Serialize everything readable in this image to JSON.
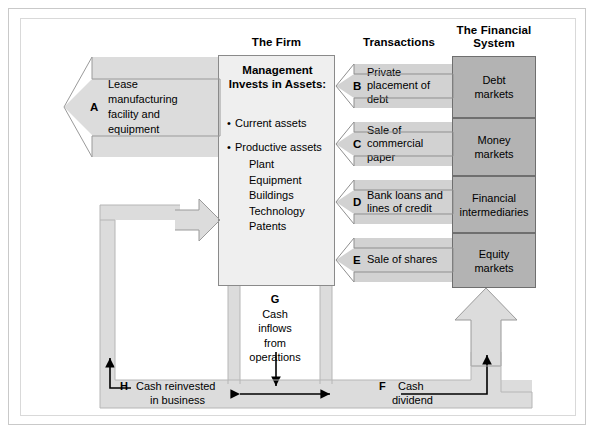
{
  "column_titles": {
    "firm": "The Firm",
    "transactions": "Transactions",
    "financial_system_line1": "The Financial",
    "financial_system_line2": "System"
  },
  "firm": {
    "heading_line1": "Management",
    "heading_line2": "Invests in Assets:",
    "bullets": [
      {
        "label": "Current assets"
      },
      {
        "label": "Productive assets"
      }
    ],
    "sub_items": [
      "Plant",
      "Equipment",
      "Buildings",
      "Technology",
      "Patents"
    ]
  },
  "lease_arrow": {
    "letter": "A",
    "text_line1": "Lease",
    "text_line2": "manufacturing",
    "text_line3": "facility and",
    "text_line4": "equipment"
  },
  "transactions": [
    {
      "letter": "B",
      "line1": "Private",
      "line2": "placement of debt"
    },
    {
      "letter": "C",
      "line1": "Sale of",
      "line2": "commercial paper"
    },
    {
      "letter": "D",
      "line1": "Bank loans and",
      "line2": "lines of credit"
    },
    {
      "letter": "E",
      "line1": "Sale of shares",
      "line2": ""
    }
  ],
  "financial_system": [
    {
      "line1": "Debt",
      "line2": "markets"
    },
    {
      "line1": "Money",
      "line2": "markets"
    },
    {
      "line1": "Financial",
      "line2": "intermediaries"
    },
    {
      "line1": "Equity",
      "line2": "markets"
    }
  ],
  "cash_flows": {
    "g": {
      "letter": "G",
      "line1": "Cash",
      "line2": "inflows",
      "line3": "from",
      "line4": "operations"
    },
    "h": {
      "letter": "H",
      "line1": "Cash reinvested",
      "line2": "in business"
    },
    "f": {
      "letter": "F",
      "line1": "Cash",
      "line2": "dividend"
    }
  },
  "colors": {
    "firm_box": "#efefef",
    "market_box": "#b3b3b3",
    "transaction_arrow": "#d2d2d2",
    "flow_band": "#dcdcdc",
    "outline": "#6f6f6f",
    "ink": "#000000"
  }
}
